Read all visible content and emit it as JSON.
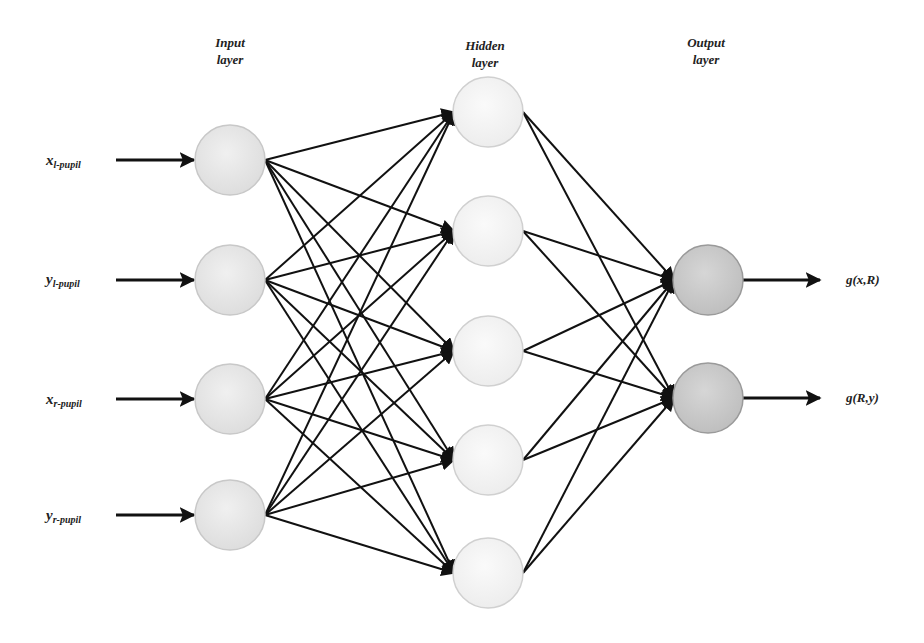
{
  "diagram": {
    "type": "feedforward-neural-network",
    "layers": [
      {
        "id": "input",
        "title_line1": "Input",
        "title_line2": "layer",
        "title_x": 230,
        "title_y": 34,
        "node_fill": "#e4e4e4",
        "node_stroke": "#c8c8c8",
        "nodes": [
          {
            "x": 230,
            "y": 160,
            "label_main": "x",
            "label_sub": "l-pupil",
            "label_x": 46
          },
          {
            "x": 230,
            "y": 280,
            "label_main": "y",
            "label_sub": "l-pupil",
            "label_x": 46
          },
          {
            "x": 230,
            "y": 399,
            "label_main": "x",
            "label_sub": "r-pupil",
            "label_x": 46
          },
          {
            "x": 230,
            "y": 515,
            "label_main": "y",
            "label_sub": "r-pupil",
            "label_x": 46
          }
        ]
      },
      {
        "id": "hidden",
        "title_line1": "Hidden",
        "title_line2": "layer",
        "title_x": 485,
        "title_y": 37,
        "node_fill": "#f1f1f1",
        "node_stroke": "#d0d0d0",
        "nodes": [
          {
            "x": 488,
            "y": 112
          },
          {
            "x": 488,
            "y": 231
          },
          {
            "x": 488,
            "y": 351
          },
          {
            "x": 488,
            "y": 460
          },
          {
            "x": 488,
            "y": 573
          }
        ]
      },
      {
        "id": "output",
        "title_line1": "Output",
        "title_line2": "layer",
        "title_x": 706,
        "title_y": 34,
        "node_fill": "#c9c9c9",
        "node_stroke": "#9a9a9a",
        "nodes": [
          {
            "x": 708,
            "y": 280,
            "label": "g(x,R)",
            "label_x": 846
          },
          {
            "x": 708,
            "y": 398,
            "label": "g(R,y)",
            "label_x": 846
          }
        ]
      }
    ],
    "node_radius": 35,
    "edge_color": "#111111",
    "connections": "fully-connected input→hidden and hidden→output"
  }
}
